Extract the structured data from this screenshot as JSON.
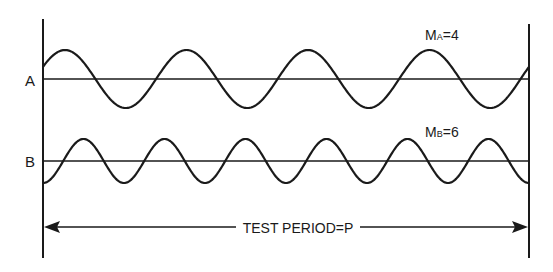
{
  "diagram": {
    "traces": [
      {
        "id": "A",
        "label": "A",
        "modulation_symbol": "M",
        "modulation_subscript": "A",
        "modulation_value": "4",
        "cycles": 4,
        "baseline_y": 79,
        "amplitude": 29,
        "phase_peak_x": 65
      },
      {
        "id": "B",
        "label": "B",
        "modulation_symbol": "M",
        "modulation_subscript": "B",
        "modulation_value": "6",
        "cycles": 6,
        "baseline_y": 161,
        "amplitude": 22,
        "phase_peak_x": 83.5
      }
    ],
    "test_period_label": "TEST PERIOD=P",
    "equals": "=",
    "line_color": "#1a1a1a",
    "background": "#ffffff"
  }
}
